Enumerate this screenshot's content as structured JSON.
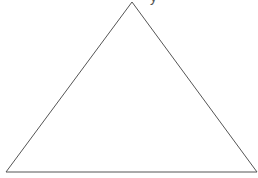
{
  "diagram": {
    "type": "triangle-outline",
    "stroke_color": "#555555",
    "stroke_width": 1,
    "fill": "none",
    "vertices": {
      "apex": [
        132,
        2
      ],
      "bottom_left": [
        6,
        172
      ],
      "bottom_right": [
        257,
        172
      ]
    }
  },
  "cropped_text": {
    "left": "",
    "right": "y"
  }
}
